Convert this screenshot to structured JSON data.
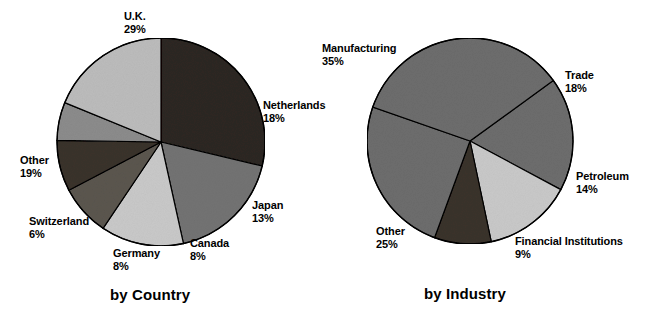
{
  "figure": {
    "background": "#ffffff",
    "text_color": "#000000"
  },
  "chart_data": [
    {
      "type": "pie",
      "title": "by Country",
      "id": "by-country",
      "unit": "%",
      "start_angle_deg": 0,
      "direction": "clockwise",
      "center": [
        161,
        142
      ],
      "radius": 104,
      "categories": [
        "U.K.",
        "Netherlands",
        "Japan",
        "Canada",
        "Germany",
        "Switzerland",
        "Other"
      ],
      "values": [
        29,
        18,
        13,
        8,
        8,
        6,
        19
      ],
      "labels": [
        "U.K.",
        "Netherlands",
        "Japan",
        "Canada",
        "Germany",
        "Switzerland",
        "Other"
      ],
      "value_labels": [
        "29%",
        "18%",
        "13%",
        "8%",
        "8%",
        "6%",
        "19%"
      ],
      "colors": [
        "#2d2722",
        "#737373",
        "#c9c9c9",
        "#5b564f",
        "#3a322c",
        "#8c8c8c",
        "#bcbcbc"
      ],
      "stroke": "#000000"
    },
    {
      "type": "pie",
      "title": "by Industry",
      "id": "by-industry",
      "unit": "%",
      "start_angle_deg": 0,
      "direction": "clockwise",
      "center": [
        470,
        141
      ],
      "radius": 103,
      "categories": [
        "Manufacturing",
        "Trade",
        "Petroleum",
        "Financial Institutions",
        "Other"
      ],
      "values": [
        35,
        18,
        14,
        9,
        25
      ],
      "labels": [
        "Manufacturing",
        "Trade",
        "Petroleum",
        "Financial Institutions",
        "Other"
      ],
      "value_labels": [
        "35%",
        "18%",
        "14%",
        "9%",
        "25%"
      ],
      "colors": [
        "#6d6d6d",
        "#6d6d6d",
        "#c9c9c9",
        "#3a322c",
        "#6d6d6d"
      ],
      "stroke": "#000000"
    }
  ],
  "country_chart": {
    "caption": "by Country",
    "labels": {
      "uk": {
        "name": "U.K.",
        "pct": "29%"
      },
      "netherlands": {
        "name": "Netherlands",
        "pct": "18%"
      },
      "japan": {
        "name": "Japan",
        "pct": "13%"
      },
      "canada": {
        "name": "Canada",
        "pct": "8%"
      },
      "germany": {
        "name": "Germany",
        "pct": "8%"
      },
      "switzerland": {
        "name": "Switzerland",
        "pct": "6%"
      },
      "other": {
        "name": "Other",
        "pct": "19%"
      }
    }
  },
  "industry_chart": {
    "caption": "by Industry",
    "labels": {
      "manufacturing": {
        "name": "Manufacturing",
        "pct": "35%"
      },
      "trade": {
        "name": "Trade",
        "pct": "18%"
      },
      "petroleum": {
        "name": "Petroleum",
        "pct": "14%"
      },
      "financial": {
        "name": "Financial Institutions",
        "pct": "9%"
      },
      "other": {
        "name": "Other",
        "pct": "25%"
      }
    }
  }
}
